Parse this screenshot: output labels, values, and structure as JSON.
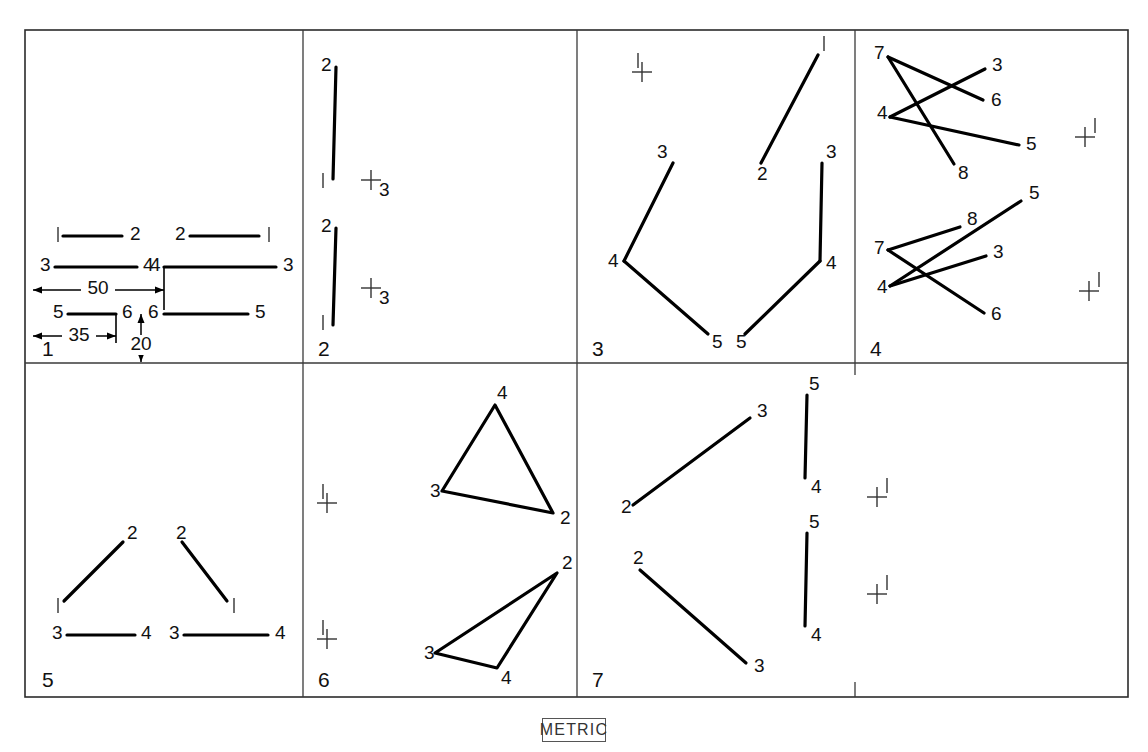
{
  "sheet": {
    "title": "Orthographic line-and-point exercise sheet",
    "metric_note": "METRIC",
    "frame": {
      "x": 25,
      "y": 30,
      "w": 1103,
      "h": 667
    },
    "background_color": "#ffffff",
    "line_color": "#000000",
    "frame_color": "#2b2b2b"
  },
  "panels": [
    {
      "id": "panel-1",
      "number": "1",
      "number_pos": {
        "x": 42,
        "y": 350
      }
    },
    {
      "id": "panel-2",
      "number": "2",
      "number_pos": {
        "x": 318,
        "y": 350
      }
    },
    {
      "id": "panel-3",
      "number": "3",
      "number_pos": {
        "x": 592,
        "y": 350
      }
    },
    {
      "id": "panel-4",
      "number": "4",
      "number_pos": {
        "x": 870,
        "y": 350
      }
    },
    {
      "id": "panel-5",
      "number": "5",
      "number_pos": {
        "x": 42,
        "y": 681
      }
    },
    {
      "id": "panel-6",
      "number": "6",
      "number_pos": {
        "x": 318,
        "y": 681
      }
    },
    {
      "id": "panel-7",
      "number": "7",
      "number_pos": {
        "x": 592,
        "y": 681
      }
    }
  ],
  "dividers": {
    "vertical": [
      {
        "name": "divider-p1-p2",
        "x": 303,
        "y1": 30,
        "y2": 363
      },
      {
        "name": "divider-p2-p3",
        "x": 577,
        "y1": 30,
        "y2": 363
      },
      {
        "name": "divider-p3-p4",
        "x": 855,
        "y1": 30,
        "y2": 375
      },
      {
        "name": "divider-p5-p6",
        "x": 303,
        "y1": 363,
        "y2": 697
      },
      {
        "name": "divider-p6-p7",
        "x": 577,
        "y1": 363,
        "y2": 697
      },
      {
        "name": "tick-p7-right",
        "x": 855,
        "y1": 682,
        "y2": 697
      }
    ],
    "horizontal": [
      {
        "name": "divider-row",
        "y": 363,
        "x1": 25,
        "x2": 1128
      }
    ]
  },
  "panel_1": {
    "label": "Panel 1",
    "segments": [
      {
        "name": "seg-1-2-left",
        "x1": 63,
        "y1": 236,
        "x2": 122,
        "y2": 236,
        "start_label": "1",
        "end_label": "2",
        "start_label_pos": {
          "x": 55,
          "y": 235
        },
        "end_label_pos": {
          "x": 130,
          "y": 235
        }
      },
      {
        "name": "seg-2-1-right",
        "x1": 190,
        "y1": 236,
        "x2": 259,
        "y2": 236,
        "start_label": "2",
        "end_label": "1",
        "start_label_pos": {
          "x": 175,
          "y": 235
        },
        "end_label_pos": {
          "x": 266,
          "y": 235
        }
      },
      {
        "name": "seg-3-4-left",
        "x1": 55,
        "y1": 267,
        "x2": 137,
        "y2": 267,
        "start_label": "3",
        "end_label": "4",
        "start_label_pos": {
          "x": 40,
          "y": 266
        },
        "end_label_pos": {
          "x": 143,
          "y": 266
        }
      },
      {
        "name": "seg-4-3-right",
        "x1": 164,
        "y1": 267,
        "x2": 276,
        "y2": 267,
        "start_label": "4",
        "end_label": "3",
        "start_label_pos": {
          "x": 150,
          "y": 266
        },
        "end_label_pos": {
          "x": 283,
          "y": 266
        }
      },
      {
        "name": "seg-5-6-left",
        "x1": 68,
        "y1": 314,
        "x2": 116,
        "y2": 314,
        "start_label": "5",
        "end_label": "6",
        "start_label_pos": {
          "x": 53,
          "y": 313
        },
        "end_label_pos": {
          "x": 122,
          "y": 313
        }
      },
      {
        "name": "seg-6-5-right",
        "x1": 164,
        "y1": 314,
        "x2": 248,
        "y2": 314,
        "start_label": "6",
        "end_label": "5",
        "start_label_pos": {
          "x": 148,
          "y": 313
        },
        "end_label_pos": {
          "x": 255,
          "y": 313
        }
      }
    ],
    "dimensions": [
      {
        "name": "dim-50",
        "value": "50",
        "orientation": "horizontal",
        "x1": 33,
        "x2": 164,
        "y": 290,
        "text_pos": {
          "x": 98,
          "y": 289
        }
      },
      {
        "name": "dim-35",
        "value": "35",
        "orientation": "horizontal",
        "x1": 33,
        "x2": 116,
        "y": 336,
        "text_pos": {
          "x": 79,
          "y": 336
        }
      },
      {
        "name": "dim-20",
        "value": "20",
        "orientation": "vertical",
        "y1": 314,
        "y2": 362,
        "x": 141,
        "text_pos": {
          "x": 141,
          "y": 345
        }
      }
    ],
    "extension_lines": [
      {
        "name": "ext-vert-164",
        "x1": 164,
        "y1": 267,
        "x2": 164,
        "y2": 310
      },
      {
        "name": "ext-vert-116",
        "x1": 116,
        "y1": 314,
        "x2": 116,
        "y2": 343
      }
    ]
  },
  "panel_2": {
    "label": "Panel 2",
    "segments": [
      {
        "name": "seg-2-1-upper",
        "x1": 336,
        "y1": 67,
        "x2": 333,
        "y2": 179,
        "start_label": "2",
        "end_label": "1",
        "start_label_pos": {
          "x": 321,
          "y": 66
        },
        "end_label_pos": {
          "x": 320,
          "y": 181
        }
      },
      {
        "name": "seg-2-1-lower",
        "x1": 336,
        "y1": 228,
        "x2": 333,
        "y2": 325,
        "start_label": "2",
        "end_label": "1",
        "start_label_pos": {
          "x": 321,
          "y": 227
        },
        "end_label_pos": {
          "x": 320,
          "y": 323
        }
      }
    ],
    "point_marks": [
      {
        "name": "point-mark-3-upper",
        "x": 371,
        "y": 180,
        "label": "3",
        "label_pos": {
          "x": 379,
          "y": 191
        }
      },
      {
        "name": "point-mark-3-lower",
        "x": 371,
        "y": 288,
        "label": "3",
        "label_pos": {
          "x": 379,
          "y": 299
        }
      }
    ]
  },
  "panel_3": {
    "label": "Panel 3",
    "segments": [
      {
        "name": "seg-1-2",
        "x1": 818,
        "y1": 55,
        "x2": 761,
        "y2": 163,
        "start_label": "1",
        "end_label": "2",
        "start_label_pos": {
          "x": 821,
          "y": 44
        },
        "end_label_pos": {
          "x": 757,
          "y": 175
        }
      },
      {
        "name": "seg-3-4-left",
        "x1": 673,
        "y1": 163,
        "x2": 624,
        "y2": 261,
        "start_label": "3",
        "end_label": "4",
        "start_label_pos": {
          "x": 657,
          "y": 153
        },
        "end_label_pos": {
          "x": 608,
          "y": 262
        }
      },
      {
        "name": "seg-4-5-left",
        "x1": 624,
        "y1": 261,
        "x2": 708,
        "y2": 334,
        "start_label": "",
        "end_label": "5",
        "end_label_pos": {
          "x": 712,
          "y": 343
        }
      },
      {
        "name": "seg-3-4-right",
        "x1": 822,
        "y1": 163,
        "x2": 820,
        "y2": 261,
        "start_label": "3",
        "end_label": "4",
        "start_label_pos": {
          "x": 826,
          "y": 153
        },
        "end_label_pos": {
          "x": 826,
          "y": 264
        }
      },
      {
        "name": "seg-4-5-right",
        "x1": 820,
        "y1": 261,
        "x2": 745,
        "y2": 334,
        "start_label": "",
        "end_label": "5",
        "end_label_pos": {
          "x": 736,
          "y": 343
        }
      }
    ],
    "point_marks": [
      {
        "name": "point-mark-1",
        "x": 642,
        "y": 72,
        "label": "1",
        "label_pos": {
          "x": 635,
          "y": 61
        }
      }
    ]
  },
  "panel_4": {
    "label": "Panel 4",
    "segments": [
      {
        "name": "seg-7-6-upper",
        "x1": 888,
        "y1": 57,
        "x2": 983,
        "y2": 100,
        "start_label": "7",
        "end_label": "6",
        "start_label_pos": {
          "x": 874,
          "y": 54
        },
        "end_label_pos": {
          "x": 991,
          "y": 101
        }
      },
      {
        "name": "seg-7-8-upper",
        "x1": 888,
        "y1": 57,
        "x2": 954,
        "y2": 164,
        "start_label": "",
        "end_label": "8",
        "end_label_pos": {
          "x": 958,
          "y": 174
        }
      },
      {
        "name": "seg-4-3-upper",
        "x1": 890,
        "y1": 117,
        "x2": 985,
        "y2": 69,
        "start_label": "4",
        "end_label": "3",
        "start_label_pos": {
          "x": 877,
          "y": 114
        },
        "end_label_pos": {
          "x": 992,
          "y": 66
        }
      },
      {
        "name": "seg-4-5-upper",
        "x1": 890,
        "y1": 117,
        "x2": 1019,
        "y2": 145,
        "start_label": "",
        "end_label": "5",
        "end_label_pos": {
          "x": 1026,
          "y": 145
        }
      },
      {
        "name": "seg-7-8-lower",
        "x1": 888,
        "y1": 250,
        "x2": 960,
        "y2": 227,
        "start_label": "7",
        "end_label": "8",
        "start_label_pos": {
          "x": 874,
          "y": 249
        },
        "end_label_pos": {
          "x": 967,
          "y": 220
        }
      },
      {
        "name": "seg-7-6-lower",
        "x1": 888,
        "y1": 250,
        "x2": 984,
        "y2": 313,
        "start_label": "",
        "end_label": "6",
        "end_label_pos": {
          "x": 991,
          "y": 315
        }
      },
      {
        "name": "seg-4-3-lower",
        "x1": 890,
        "y1": 286,
        "x2": 986,
        "y2": 256,
        "start_label": "4",
        "end_label": "3",
        "start_label_pos": {
          "x": 877,
          "y": 288
        },
        "end_label_pos": {
          "x": 993,
          "y": 253
        }
      },
      {
        "name": "seg-4-5-lower",
        "x1": 890,
        "y1": 286,
        "x2": 1021,
        "y2": 201,
        "start_label": "",
        "end_label": "5",
        "end_label_pos": {
          "x": 1029,
          "y": 194
        }
      }
    ],
    "point_marks": [
      {
        "name": "point-mark-1-upper",
        "x": 1085,
        "y": 137,
        "label": "1",
        "label_pos": {
          "x": 1092,
          "y": 126
        }
      },
      {
        "name": "point-mark-1-lower",
        "x": 1089,
        "y": 291,
        "label": "1",
        "label_pos": {
          "x": 1096,
          "y": 280
        }
      }
    ]
  },
  "panel_5": {
    "label": "Panel 5",
    "segments": [
      {
        "name": "seg-1-2-left",
        "x1": 64,
        "y1": 601,
        "x2": 123,
        "y2": 542,
        "start_label": "1",
        "end_label": "2",
        "start_label_pos": {
          "x": 55,
          "y": 606
        },
        "end_label_pos": {
          "x": 127,
          "y": 534
        }
      },
      {
        "name": "seg-2-1-right",
        "x1": 182,
        "y1": 542,
        "x2": 227,
        "y2": 601,
        "start_label": "2",
        "end_label": "1",
        "start_label_pos": {
          "x": 176,
          "y": 534
        },
        "end_label_pos": {
          "x": 231,
          "y": 606
        }
      },
      {
        "name": "seg-3-4-left",
        "x1": 67,
        "y1": 635,
        "x2": 135,
        "y2": 635,
        "start_label": "3",
        "end_label": "4",
        "start_label_pos": {
          "x": 52,
          "y": 634
        },
        "end_label_pos": {
          "x": 141,
          "y": 634
        }
      },
      {
        "name": "seg-3-4-right",
        "x1": 184,
        "y1": 635,
        "x2": 268,
        "y2": 635,
        "start_label": "3",
        "end_label": "4",
        "start_label_pos": {
          "x": 169,
          "y": 634
        },
        "end_label_pos": {
          "x": 275,
          "y": 634
        }
      }
    ]
  },
  "panel_6": {
    "label": "Panel 6",
    "triangles": [
      {
        "name": "triangle-upper",
        "vertices": [
          {
            "label": "4",
            "x": 495,
            "y": 405,
            "label_pos": {
              "x": 497,
              "y": 394
            }
          },
          {
            "label": "2",
            "x": 553,
            "y": 513,
            "label_pos": {
              "x": 560,
              "y": 519
            }
          },
          {
            "label": "3",
            "x": 442,
            "y": 491,
            "label_pos": {
              "x": 430,
              "y": 492
            }
          }
        ]
      },
      {
        "name": "triangle-lower",
        "vertices": [
          {
            "label": "2",
            "x": 557,
            "y": 573,
            "label_pos": {
              "x": 562,
              "y": 564
            }
          },
          {
            "label": "4",
            "x": 497,
            "y": 668,
            "label_pos": {
              "x": 501,
              "y": 679
            }
          },
          {
            "label": "3",
            "x": 435,
            "y": 653,
            "label_pos": {
              "x": 424,
              "y": 654
            }
          }
        ]
      }
    ],
    "point_marks": [
      {
        "name": "point-mark-1-upper",
        "x": 327,
        "y": 503,
        "label": "1",
        "label_pos": {
          "x": 320,
          "y": 492
        }
      },
      {
        "name": "point-mark-1-lower",
        "x": 327,
        "y": 639,
        "label": "1",
        "label_pos": {
          "x": 320,
          "y": 628
        }
      }
    ]
  },
  "panel_7": {
    "label": "Panel 7",
    "segments": [
      {
        "name": "seg-2-3-upper",
        "x1": 633,
        "y1": 505,
        "x2": 750,
        "y2": 418,
        "start_label": "2",
        "end_label": "3",
        "start_label_pos": {
          "x": 621,
          "y": 508
        },
        "end_label_pos": {
          "x": 757,
          "y": 412
        }
      },
      {
        "name": "seg-2-3-lower",
        "x1": 640,
        "y1": 570,
        "x2": 746,
        "y2": 663,
        "start_label": "2",
        "end_label": "3",
        "start_label_pos": {
          "x": 633,
          "y": 559
        },
        "end_label_pos": {
          "x": 754,
          "y": 667
        }
      },
      {
        "name": "seg-5-4-upper",
        "x1": 807,
        "y1": 395,
        "x2": 805,
        "y2": 478,
        "start_label": "5",
        "end_label": "4",
        "start_label_pos": {
          "x": 809,
          "y": 385
        },
        "end_label_pos": {
          "x": 811,
          "y": 488
        }
      },
      {
        "name": "seg-5-4-lower",
        "x1": 807,
        "y1": 533,
        "x2": 805,
        "y2": 626,
        "start_label": "5",
        "end_label": "4",
        "start_label_pos": {
          "x": 809,
          "y": 523
        },
        "end_label_pos": {
          "x": 811,
          "y": 636
        }
      }
    ],
    "point_marks": [
      {
        "name": "point-mark-1-upper",
        "x": 877,
        "y": 497,
        "label": "1",
        "label_pos": {
          "x": 884,
          "y": 486
        }
      },
      {
        "name": "point-mark-1-lower",
        "x": 877,
        "y": 594,
        "label": "1",
        "label_pos": {
          "x": 884,
          "y": 583
        }
      }
    ]
  }
}
